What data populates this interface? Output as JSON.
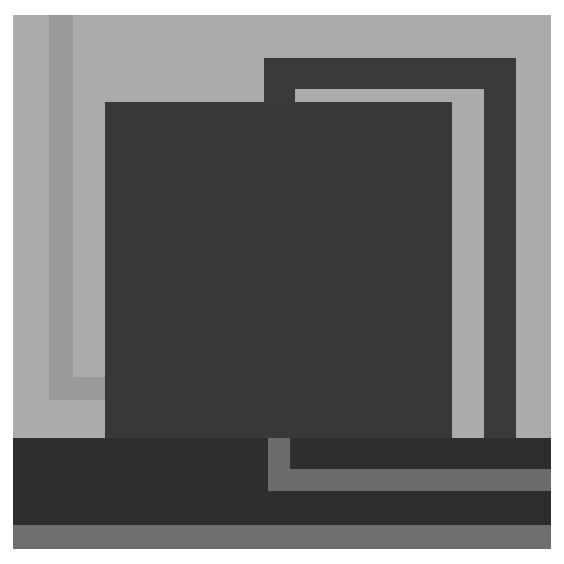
{
  "artwork": {
    "description": "Abstract geometric grayscale composition",
    "colors": {
      "background": "#ababab",
      "left_stripe": "#999999",
      "dark_square": "#383838",
      "frame": "#3a3a3a",
      "frame_inner_light": "#ababab",
      "bottom_band": "#2e2e2e",
      "bottom_l_shape": "#6b6b6b",
      "bottom_strip": "#6e6e6e"
    }
  }
}
